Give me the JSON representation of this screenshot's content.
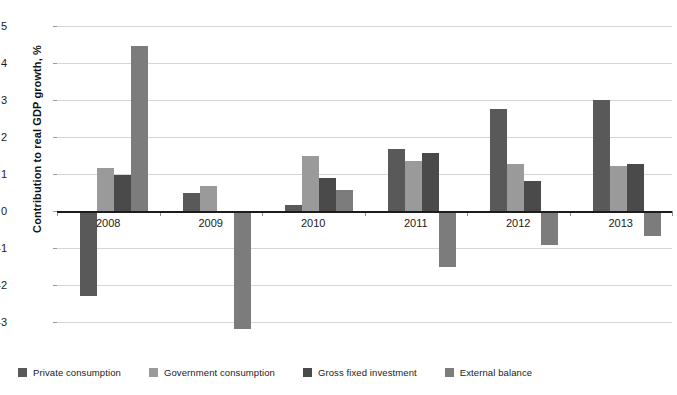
{
  "chart_data": {
    "type": "bar",
    "title": "",
    "subtitle": "",
    "xlabel": "",
    "ylabel": "Contribution to real GDP growth, %",
    "categories": [
      "2008",
      "2009",
      "2010",
      "2011",
      "2012",
      "2013"
    ],
    "ylim": [
      -3,
      5
    ],
    "ytick_labels": [
      "5",
      "4",
      "3",
      "2",
      "1",
      "0",
      "-1",
      "-2",
      "-3"
    ],
    "ytick_values": [
      5,
      4,
      3,
      2,
      1,
      0,
      -1,
      -2,
      -3
    ],
    "grid": true,
    "legend_position": "bottom-left",
    "series": [
      {
        "name": "Private consumption",
        "color": "#595959",
        "values": [
          -2.3,
          0.48,
          0.17,
          1.67,
          2.76,
          3.0
        ]
      },
      {
        "name": "Government consumption",
        "color": "#9a9a9a",
        "values": [
          1.17,
          0.68,
          1.48,
          1.35,
          1.28,
          1.22
        ]
      },
      {
        "name": "Gross fixed investment",
        "color": "#4a4a4a",
        "values": [
          0.98,
          -0.05,
          0.88,
          1.57,
          0.8,
          1.28
        ]
      },
      {
        "name": "External balance",
        "color": "#7c7c7c",
        "values": [
          4.45,
          -3.2,
          0.58,
          -1.52,
          -0.92,
          -0.68
        ]
      }
    ]
  },
  "axis": {
    "y_title": "Contribution to real GDP growth, %"
  },
  "legend": {
    "items": [
      {
        "label": "Private consumption",
        "color": "#595959"
      },
      {
        "label": "Government consumption",
        "color": "#9a9a9a"
      },
      {
        "label": "Gross fixed investment",
        "color": "#4a4a4a"
      },
      {
        "label": "External balance",
        "color": "#7c7c7c"
      }
    ]
  }
}
